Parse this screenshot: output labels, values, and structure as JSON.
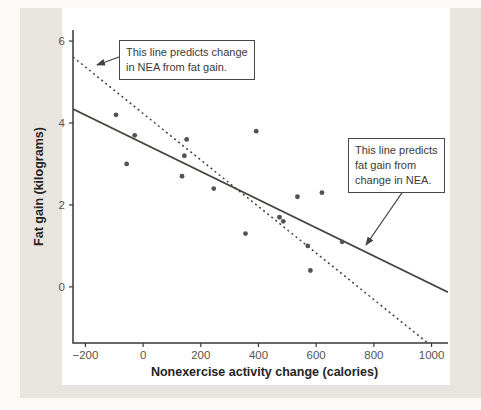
{
  "figure": {
    "colors": {
      "page_background": "#fbfaf7",
      "panel_background": "#e8e5e0",
      "plot_background": "#ffffff"
    }
  },
  "chart_data": {
    "type": "scatter",
    "title": "",
    "xlabel": "Nonexercise activity change (calories)",
    "ylabel": "Fat gain (kilograms)",
    "xlim": [
      -243,
      1057
    ],
    "ylim": [
      -1.37,
      6.27
    ],
    "grid": false,
    "legend": "none",
    "x_ticks": {
      "values": [
        -200,
        0,
        200,
        400,
        600,
        800,
        1000
      ],
      "labels": [
        "−200",
        "0",
        "200",
        "400",
        "600",
        "800",
        "1000"
      ]
    },
    "y_ticks": {
      "values": [
        0,
        2,
        4,
        6
      ],
      "labels": [
        "0",
        "2",
        "4",
        "6"
      ]
    },
    "points": [
      [
        -94,
        4.2
      ],
      [
        -57,
        3.0
      ],
      [
        -29,
        3.7
      ],
      [
        135,
        2.7
      ],
      [
        143,
        3.2
      ],
      [
        151,
        3.6
      ],
      [
        245,
        2.4
      ],
      [
        355,
        1.3
      ],
      [
        392,
        3.8
      ],
      [
        473,
        1.7
      ],
      [
        486,
        1.6
      ],
      [
        535,
        2.2
      ],
      [
        571,
        1.0
      ],
      [
        580,
        0.4
      ],
      [
        620,
        2.3
      ],
      [
        690,
        1.1
      ]
    ],
    "lines": [
      {
        "id": "fat-on-nea",
        "style": "solid",
        "slope": -0.00344,
        "intercept": 3.505,
        "description": "This line predicts fat gain from change in NEA."
      },
      {
        "id": "nea-on-fat",
        "style": "dashed",
        "slope": -0.005678,
        "intercept": 4.232,
        "description": "This line predicts change in NEA from fat gain."
      }
    ],
    "colors": {
      "point": "#545150",
      "line": "#45423f",
      "axis": "#3a3836",
      "tick_label": "#57534e",
      "axis_title": "#262422"
    }
  },
  "annotations": {
    "nea_from_fat": {
      "line1": "This line predicts change",
      "line2": "in NEA from fat gain."
    },
    "fat_from_nea": {
      "line1": "This line predicts",
      "line2": "fat gain from",
      "line3": "change in NEA."
    }
  }
}
